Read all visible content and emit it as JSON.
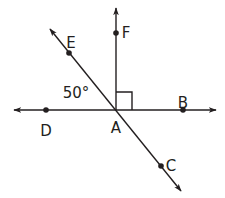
{
  "diagram": {
    "title": "",
    "stroke_color": "#231f20",
    "background": "#ffffff",
    "vertex": {
      "name": "A",
      "x": 116,
      "y": 110,
      "label_x": 116,
      "label_y": 133
    },
    "lines": [
      {
        "id": "line-DB",
        "description": "horizontal line through D, A, B",
        "x1": 14,
        "y1": 110,
        "x2": 216,
        "y2": 110,
        "arrow_start": true,
        "arrow_end": true
      },
      {
        "id": "line-EC",
        "description": "diagonal line through E, A, C",
        "x1": 50,
        "y1": 29,
        "x2": 181,
        "y2": 191,
        "arrow_start": true,
        "arrow_end": true
      },
      {
        "id": "ray-AF",
        "description": "vertical ray from A through F",
        "x1": 116,
        "y1": 110,
        "x2": 116,
        "y2": 8,
        "arrow_start": false,
        "arrow_end": true
      }
    ],
    "points": [
      {
        "name": "F",
        "x": 116,
        "y": 33,
        "label_x": 126,
        "label_y": 33
      },
      {
        "name": "E",
        "x": 69,
        "y": 53,
        "label_x": 71,
        "label_y": 43
      },
      {
        "name": "B",
        "x": 183,
        "y": 110,
        "label_x": 183,
        "label_y": 103
      },
      {
        "name": "D",
        "x": 46,
        "y": 110,
        "label_x": 46,
        "label_y": 131
      },
      {
        "name": "C",
        "x": 161,
        "y": 166,
        "label_x": 171,
        "label_y": 166
      }
    ],
    "angle_label": {
      "text": "50°",
      "x": 76,
      "y": 98,
      "between": [
        "AD",
        "AE"
      ]
    },
    "right_angle_marker": {
      "x": 116,
      "y": 92,
      "size": 16,
      "between": [
        "AF",
        "AB"
      ]
    },
    "top_partial_glyph": ""
  }
}
